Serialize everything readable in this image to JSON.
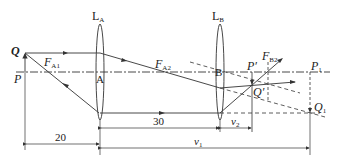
{
  "diagram": {
    "type": "optics-two-lens-ray-diagram",
    "labels": {
      "lens_a": "L",
      "lens_a_sub": "A",
      "lens_b": "L",
      "lens_b_sub": "B",
      "point_q": "Q",
      "point_p": "P",
      "focus_a1": "F",
      "focus_a1_sub": "A1",
      "focus_a2": "F",
      "focus_a2_sub": "A2",
      "focus_b2": "F",
      "focus_b2_sub": "B2",
      "center_a": "A",
      "center_b": "B",
      "point_p_prime": "P′",
      "point_q_prime": "Q′",
      "point_p1": "P",
      "point_p1_sub": "1",
      "point_q1": "Q",
      "point_q1_sub": "1"
    },
    "dimensions": {
      "object_distance": "20",
      "lens_separation": "30",
      "image_distance_1": "v",
      "image_distance_1_sub": "1",
      "image_distance_2": "v",
      "image_distance_2_sub": "2"
    },
    "colors": {
      "line": "#333333",
      "background": "#ffffff"
    }
  }
}
